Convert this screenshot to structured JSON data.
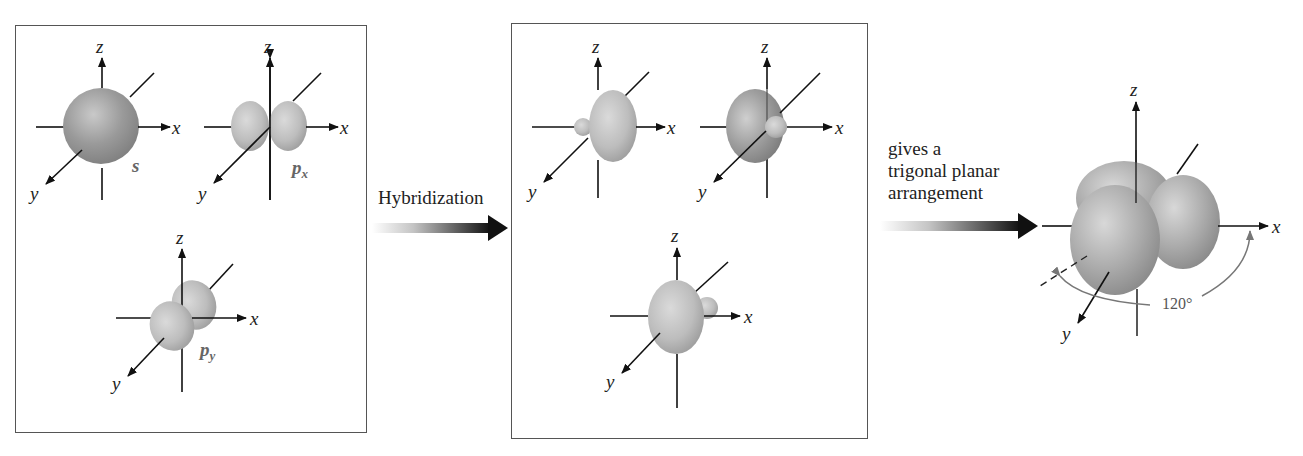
{
  "figure": {
    "panel_left": {
      "orbitals": [
        {
          "name": "s",
          "label": "s",
          "sub": "",
          "axes": {
            "x": "x",
            "y": "y",
            "z": "z"
          }
        },
        {
          "name": "px",
          "label": "p",
          "sub": "x",
          "axes": {
            "x": "x",
            "y": "y",
            "z": "z"
          }
        },
        {
          "name": "py",
          "label": "p",
          "sub": "y",
          "axes": {
            "x": "x",
            "y": "y",
            "z": "z"
          }
        }
      ]
    },
    "arrow_1": {
      "label": "Hybridization"
    },
    "panel_middle": {
      "orbitals": [
        {
          "name": "sp2-a",
          "axes": {
            "x": "x",
            "y": "y",
            "z": "z"
          }
        },
        {
          "name": "sp2-b",
          "axes": {
            "x": "x",
            "y": "y",
            "z": "z"
          }
        },
        {
          "name": "sp2-c",
          "axes": {
            "x": "x",
            "y": "y",
            "z": "z"
          }
        }
      ]
    },
    "arrow_2": {
      "label_lines": [
        "gives a",
        "trigonal planar",
        "arrangement"
      ]
    },
    "result": {
      "axes": {
        "x": "x",
        "y": "y",
        "z": "z"
      },
      "angle_label": "120°"
    },
    "colors": {
      "orbital_fill": "#b8b8b8",
      "orbital_dark": "#8c8c8c",
      "axis": "#111111",
      "frame": "#555555",
      "angle_arc": "#777777"
    }
  }
}
